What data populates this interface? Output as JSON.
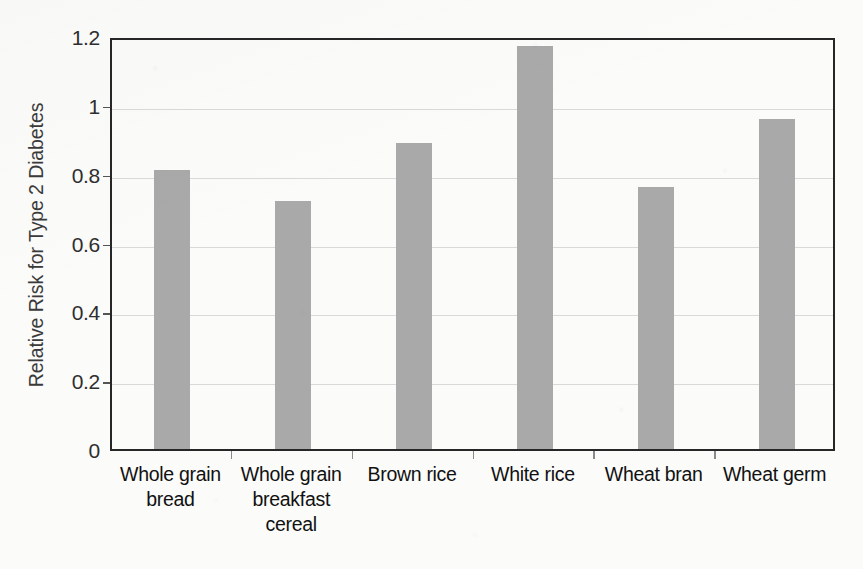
{
  "chart_data": {
    "type": "bar",
    "title": "",
    "xlabel": "",
    "ylabel": "Relative Risk for Type 2 Diabetes",
    "categories": [
      "Whole grain bread",
      "Whole grain breakfast cereal",
      "Brown rice",
      "White rice",
      "Wheat bran",
      "Wheat germ"
    ],
    "category_labels_wrapped": [
      "Whole grain\nbread",
      "Whole grain\nbreakfast\ncereal",
      "Brown rice",
      "White rice",
      "Wheat bran",
      "Wheat germ"
    ],
    "values": [
      0.81,
      0.72,
      0.89,
      1.17,
      0.76,
      0.96
    ],
    "ylim": [
      0,
      1.2
    ],
    "ytick_values": [
      0,
      0.2,
      0.4,
      0.6,
      0.8,
      1,
      1.2
    ],
    "ytick_labels": [
      "0",
      "0.2",
      "0.4",
      "0.6",
      "0.8",
      "1",
      "1.2"
    ],
    "grid": true,
    "grid_axis": "y",
    "legend": false,
    "colors": {
      "bar_fill": "#a9a9a9",
      "axis_frame": "#262626",
      "gridline": "#d9d9d9",
      "text": "#111111",
      "background": "#fbfbfa"
    }
  }
}
